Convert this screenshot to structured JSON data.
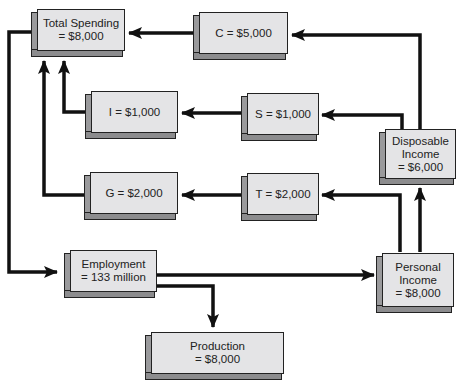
{
  "diagram": {
    "type": "circular-flow",
    "nodes": {
      "total_spending": {
        "line1": "Total Spending",
        "line2": "= $8,000"
      },
      "consumption": {
        "line1": "C = $5,000"
      },
      "investment": {
        "line1": "I = $1,000"
      },
      "saving": {
        "line1": "S = $1,000"
      },
      "disposable_income": {
        "line1": "Disposable",
        "line2": "Income",
        "line3": "= $6,000"
      },
      "government": {
        "line1": "G = $2,000"
      },
      "taxes": {
        "line1": "T = $2,000"
      },
      "employment": {
        "line1": "Employment",
        "line2": "= 133 million"
      },
      "personal_income": {
        "line1": "Personal",
        "line2": "Income",
        "line3": "= $8,000"
      },
      "production": {
        "line1": "Production",
        "line2": "= $8,000"
      }
    },
    "edges": [
      {
        "from": "Total Spending",
        "to": "Employment"
      },
      {
        "from": "Employment",
        "to": "Personal Income"
      },
      {
        "from": "Employment",
        "to": "Production"
      },
      {
        "from": "Personal Income",
        "to": "Disposable Income"
      },
      {
        "from": "Personal Income",
        "to": "T"
      },
      {
        "from": "Disposable Income",
        "to": "C"
      },
      {
        "from": "Disposable Income",
        "to": "S"
      },
      {
        "from": "C",
        "to": "Total Spending"
      },
      {
        "from": "S",
        "to": "I"
      },
      {
        "from": "I",
        "to": "Total Spending"
      },
      {
        "from": "T",
        "to": "G"
      },
      {
        "from": "G",
        "to": "Total Spending"
      }
    ],
    "colors": {
      "box_face": "#e4e4e6",
      "box_side": "#9a9a9c",
      "line": "#111111"
    }
  }
}
